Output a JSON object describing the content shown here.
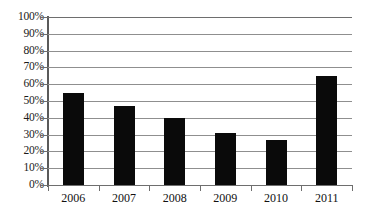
{
  "chart_data": {
    "type": "bar",
    "title": "",
    "xlabel": "",
    "ylabel": "",
    "categories": [
      "2006",
      "2007",
      "2008",
      "2009",
      "2010",
      "2011"
    ],
    "values": [
      55,
      47,
      40,
      31,
      27,
      65
    ],
    "value_unit": "%",
    "ylim": [
      0,
      100
    ],
    "ytick_step": 10,
    "ytick_labels": [
      "0%",
      "10%",
      "20%",
      "30%",
      "40%",
      "50%",
      "60%",
      "70%",
      "80%",
      "90%",
      "100%"
    ],
    "ytick_values": [
      0,
      10,
      20,
      30,
      40,
      50,
      60,
      70,
      80,
      90,
      100
    ],
    "grid": true,
    "grid_axis": "y",
    "legend": false,
    "legend_position": "none",
    "series": [
      {
        "name": "",
        "color": "#0a0a0a",
        "values": [
          55,
          47,
          40,
          31,
          27,
          65
        ]
      }
    ],
    "colors": {
      "bar": "#0a0a0a",
      "gridline": "#8f8f8f",
      "axis": "#5a5a5a",
      "background": "#ffffff",
      "text": "#111111"
    }
  }
}
